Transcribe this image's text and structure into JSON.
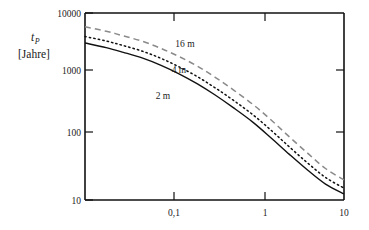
{
  "chart_data": {
    "type": "line",
    "title": "",
    "xlabel": "",
    "ylabel": "t_P [Jahre]",
    "ylabel_main": "t",
    "ylabel_sub": "P",
    "ylabel_unit": "[Jahre]",
    "xscale": "log",
    "yscale": "log",
    "xlim": [
      0.045,
      10
    ],
    "ylim": [
      10,
      10000
    ],
    "xticks": [
      0.1,
      1,
      10
    ],
    "xtick_labels": [
      "0,1",
      "1",
      "10"
    ],
    "yticks": [
      10,
      100,
      1000,
      10000
    ],
    "ytick_labels": [
      "10",
      "100",
      "1000",
      "10000"
    ],
    "grid": false,
    "legend_position": "inline-annotations",
    "series": [
      {
        "name": "16 m",
        "label": "16 m",
        "style": "dashed",
        "color": "#8a8a8a",
        "x": [
          0.045,
          0.07,
          0.1,
          0.15,
          0.22,
          0.32,
          0.47,
          0.68,
          1.0,
          1.5,
          2.2,
          3.2,
          4.7,
          6.8,
          10.0
        ],
        "y": [
          6000,
          5100,
          4300,
          3500,
          2700,
          2000,
          1400,
          930,
          580,
          340,
          190,
          103,
          56,
          32,
          21
        ]
      },
      {
        "name": "4 m",
        "label": "4 m",
        "style": "dotted",
        "color": "#111111",
        "x": [
          0.045,
          0.07,
          0.1,
          0.15,
          0.22,
          0.32,
          0.47,
          0.68,
          1.0,
          1.5,
          2.2,
          3.2,
          4.7,
          6.8,
          10.0
        ],
        "y": [
          4200,
          3550,
          3000,
          2430,
          1870,
          1370,
          950,
          630,
          395,
          232,
          130,
          71,
          39,
          23,
          15.5
        ]
      },
      {
        "name": "2 m",
        "label": "2 m",
        "style": "solid",
        "color": "#111111",
        "x": [
          0.045,
          0.07,
          0.1,
          0.15,
          0.22,
          0.32,
          0.47,
          0.68,
          1.0,
          1.5,
          2.2,
          3.2,
          4.7,
          6.8,
          10.0
        ],
        "y": [
          3300,
          2780,
          2340,
          1890,
          1450,
          1060,
          730,
          483,
          300,
          176,
          98,
          54,
          30,
          18,
          12.5
        ]
      }
    ],
    "annotations": [
      {
        "text": "16 m",
        "x_px": 185,
        "y_px": 47
      },
      {
        "text": "4 m",
        "x_px": 179,
        "y_px": 73
      },
      {
        "text": "2 m",
        "x_px": 163,
        "y_px": 99
      }
    ],
    "frame": {
      "left_px": 85,
      "right_px": 344,
      "top_px": 13,
      "bottom_px": 200
    },
    "colors": {
      "axis": "#111111",
      "background": "#ffffff",
      "series_16m": "#8a8a8a",
      "series_4m": "#111111",
      "series_2m": "#111111"
    }
  }
}
